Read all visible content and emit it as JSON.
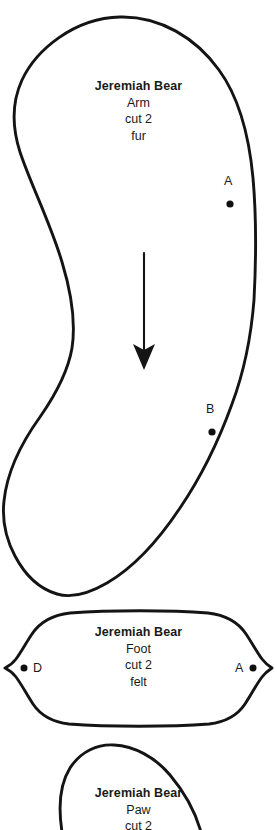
{
  "sheet": {
    "background_color": "#ffffff",
    "ink_color": "#141414",
    "description": "Printable sewing pattern sheet for a stuffed teddy bear"
  },
  "pieces": [
    {
      "id": "arm",
      "title": "Jeremiah Bear",
      "part": "Arm",
      "quantity": "cut 2",
      "material": "fur",
      "has_grain_arrow": true
    },
    {
      "id": "foot",
      "title": "Jeremiah Bear",
      "part": "Foot",
      "quantity": "cut 2",
      "material": "felt",
      "has_grain_arrow": false
    },
    {
      "id": "paw",
      "title": "Jeremiah Bear",
      "part": "Paw",
      "quantity": "cut 2",
      "material": "",
      "has_grain_arrow": false
    }
  ],
  "marks": [
    {
      "id": "arm-a",
      "label": "A",
      "piece": "arm",
      "layout": "label-above-dot"
    },
    {
      "id": "arm-b",
      "label": "B",
      "piece": "arm",
      "layout": "label-above-dot"
    },
    {
      "id": "foot-d",
      "label": "D",
      "piece": "foot",
      "layout": "dot-left-label-right"
    },
    {
      "id": "foot-a",
      "label": "A",
      "piece": "foot",
      "layout": "label-left-dot-right"
    }
  ]
}
